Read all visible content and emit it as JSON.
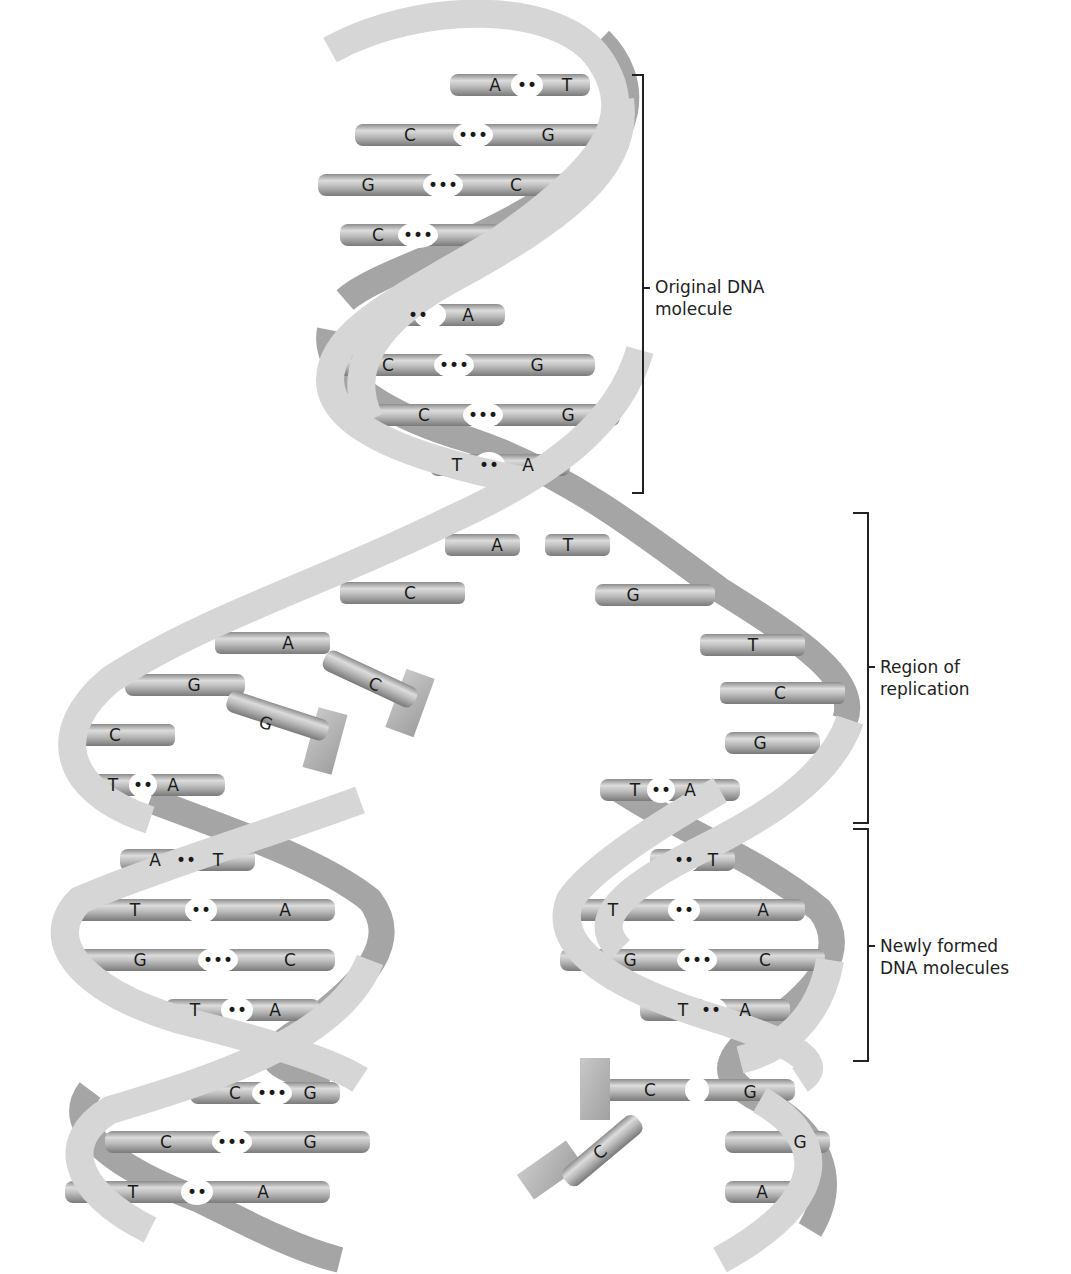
{
  "figure": {
    "colors": {
      "ribbon_front": "#d4d4d4",
      "ribbon_back": "#9a9a9a",
      "bar": "#b5b5b5",
      "text": "#222222",
      "background": "#ffffff"
    }
  },
  "labels": {
    "original": {
      "line1": "Original DNA",
      "line2": "molecule"
    },
    "replication": {
      "line1": "Region of",
      "line2": "replication"
    },
    "newly_formed": {
      "line1": "Newly formed",
      "line2": "DNA molecules"
    }
  },
  "original_molecule": {
    "base_pairs": [
      {
        "left": "A",
        "right": "T",
        "bond": "••"
      },
      {
        "left": "C",
        "right": "G",
        "bond": "•••"
      },
      {
        "left": "G",
        "right": "C",
        "bond": "•••"
      },
      {
        "left": "C",
        "right": "",
        "bond": "•••"
      },
      {
        "left": "",
        "right": "A",
        "bond": "••"
      },
      {
        "left": "C",
        "right": "G",
        "bond": "•••"
      },
      {
        "left": "C",
        "right": "G",
        "bond": "•••"
      },
      {
        "left": "T",
        "right": "A",
        "bond": "••"
      }
    ]
  },
  "replication_region": {
    "left_strand_bases": [
      "A",
      "C",
      "A",
      "G",
      "C",
      "T"
    ],
    "right_strand_bases": [
      "T",
      "G",
      "T",
      "C",
      "G",
      "T"
    ],
    "left_pair_bottom": {
      "left": "T",
      "right": "A",
      "bond": "••"
    },
    "right_pair_bottom": {
      "left": "T",
      "right": "A",
      "bond": "••"
    },
    "free_nucleotides": [
      "C",
      "G",
      "C"
    ]
  },
  "left_daughter": {
    "base_pairs": [
      {
        "left": "A",
        "right": "T",
        "bond": "••"
      },
      {
        "left": "T",
        "right": "A",
        "bond": "••"
      },
      {
        "left": "G",
        "right": "C",
        "bond": "•••"
      },
      {
        "left": "T",
        "right": "A",
        "bond": "••"
      },
      {
        "left": "C",
        "right": "G",
        "bond": "•••"
      },
      {
        "left": "C",
        "right": "G",
        "bond": "•••"
      },
      {
        "left": "T",
        "right": "A",
        "bond": "••"
      }
    ]
  },
  "right_daughter": {
    "base_pairs": [
      {
        "left": "",
        "right": "T",
        "bond": "••"
      },
      {
        "left": "T",
        "right": "A",
        "bond": "••"
      },
      {
        "left": "G",
        "right": "C",
        "bond": "•••"
      },
      {
        "left": "T",
        "right": "A",
        "bond": "••"
      },
      {
        "left": "C",
        "right": "G",
        "bond": ""
      }
    ],
    "unpaired_bases": [
      "G",
      "A"
    ]
  }
}
